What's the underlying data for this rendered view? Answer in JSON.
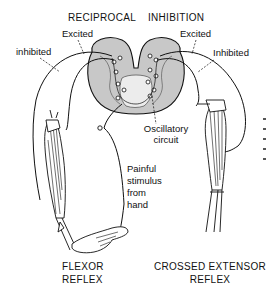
{
  "diagram": {
    "title_left": "RECIPROCAL",
    "title_right": "INHIBITION",
    "labels": {
      "inhibited_left": "inhibited",
      "excited_left": "Excited",
      "excited_right": "Excited",
      "inhibited_right": "Inhibited",
      "oscillatory_line1": "Oscillatory",
      "oscillatory_line2": "circuit",
      "painful_line1": "Painful",
      "painful_line2": "stimulus",
      "painful_line3": "from",
      "painful_line4": "hand"
    },
    "captions": {
      "flexor_line1": "FLEXOR",
      "flexor_line2": "REFLEX",
      "crossed_line1": "CROSSED EXTENSOR",
      "crossed_line2": "REFLEX"
    },
    "colors": {
      "ink": "#111111",
      "gray_matter": "#c8c8c8",
      "background": "#ffffff"
    }
  }
}
